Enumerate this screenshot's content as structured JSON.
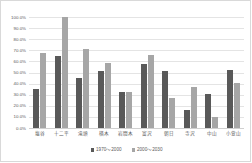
{
  "chart_data": {
    "type": "bar",
    "title": "",
    "xlabel": "",
    "ylabel": "",
    "ylim": [
      0,
      100
    ],
    "yticks": [
      "0.0%",
      "10.0%",
      "20.0%",
      "30.0%",
      "40.0%",
      "50.0%",
      "60.0%",
      "70.0%",
      "80.0%",
      "90.0%",
      "100.0%"
    ],
    "ytick_values": [
      0,
      10,
      20,
      30,
      40,
      50,
      60,
      70,
      80,
      90,
      100
    ],
    "grid": true,
    "legend_position": "bottom",
    "categories": [
      "塩谷",
      "十二平",
      "滝頭",
      "楢木",
      "岩間木",
      "富沢",
      "朝日",
      "寺沢",
      "中山",
      "小萱山"
    ],
    "series": [
      {
        "name": "1970〜2000",
        "color": "#595959",
        "values": [
          35.5,
          64.5,
          45.0,
          51.5,
          32.0,
          58.0,
          51.5,
          16.0,
          30.5,
          52.0
        ]
      },
      {
        "name": "2000〜2030",
        "color": "#a6a6a6",
        "values": [
          68.0,
          100.0,
          71.5,
          58.5,
          32.5,
          66.0,
          27.0,
          37.0,
          9.5,
          40.5
        ]
      }
    ]
  }
}
